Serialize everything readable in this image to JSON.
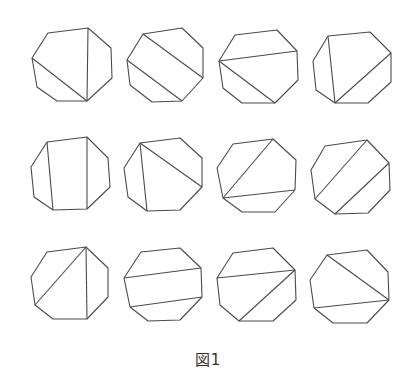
{
  "figure": {
    "caption": "図1",
    "stroke_color": "#4a4a4a",
    "octagons": [
      {
        "vertices": [
          [
            48,
            33
          ],
          [
            88,
            28
          ],
          [
            111,
            48
          ],
          [
            112,
            78
          ],
          [
            87,
            101
          ],
          [
            57,
            101
          ],
          [
            37,
            87
          ],
          [
            32,
            58
          ]
        ],
        "diagonals": [
          [
            [
              88,
              28
            ],
            [
              87,
              101
            ]
          ],
          [
            [
              32,
              58
            ],
            [
              87,
              101
            ]
          ]
        ]
      },
      {
        "vertices": [
          [
            143,
            34
          ],
          [
            182,
            28
          ],
          [
            203,
            48
          ],
          [
            203,
            78
          ],
          [
            182,
            101
          ],
          [
            152,
            102
          ],
          [
            130,
            85
          ],
          [
            127,
            60
          ]
        ],
        "diagonals": [
          [
            [
              143,
              34
            ],
            [
              203,
              78
            ]
          ],
          [
            [
              127,
              60
            ],
            [
              182,
              101
            ]
          ]
        ]
      },
      {
        "vertices": [
          [
            235,
            35
          ],
          [
            277,
            30
          ],
          [
            297,
            51
          ],
          [
            298,
            80
          ],
          [
            275,
            103
          ],
          [
            242,
            103
          ],
          [
            223,
            88
          ],
          [
            219,
            61
          ]
        ],
        "diagonals": [
          [
            [
              219,
              61
            ],
            [
              297,
              51
            ]
          ],
          [
            [
              219,
              61
            ],
            [
              275,
              103
            ]
          ]
        ]
      },
      {
        "vertices": [
          [
            328,
            36
          ],
          [
            370,
            32
          ],
          [
            391,
            53
          ],
          [
            391,
            82
          ],
          [
            368,
            103
          ],
          [
            335,
            103
          ],
          [
            316,
            90
          ],
          [
            313,
            61
          ]
        ],
        "diagonals": [
          [
            [
              328,
              36
            ],
            [
              335,
              103
            ]
          ],
          [
            [
              391,
              53
            ],
            [
              335,
              103
            ]
          ]
        ]
      },
      {
        "vertices": [
          [
            47,
            142
          ],
          [
            87,
            137
          ],
          [
            108,
            158
          ],
          [
            110,
            187
          ],
          [
            87,
            209
          ],
          [
            53,
            210
          ],
          [
            34,
            197
          ],
          [
            31,
            167
          ]
        ],
        "diagonals": [
          [
            [
              47,
              142
            ],
            [
              53,
              210
            ]
          ],
          [
            [
              87,
              137
            ],
            [
              87,
              209
            ]
          ]
        ]
      },
      {
        "vertices": [
          [
            140,
            143
          ],
          [
            180,
            138
          ],
          [
            202,
            158
          ],
          [
            202,
            187
          ],
          [
            180,
            210
          ],
          [
            147,
            211
          ],
          [
            128,
            197
          ],
          [
            124,
            168
          ]
        ],
        "diagonals": [
          [
            [
              140,
              143
            ],
            [
              147,
              211
            ]
          ],
          [
            [
              140,
              143
            ],
            [
              202,
              187
            ]
          ]
        ]
      },
      {
        "vertices": [
          [
            233,
            144
          ],
          [
            273,
            139
          ],
          [
            296,
            160
          ],
          [
            295,
            190
          ],
          [
            275,
            212
          ],
          [
            242,
            212
          ],
          [
            223,
            198
          ],
          [
            217,
            168
          ]
        ],
        "diagonals": [
          [
            [
              273,
              139
            ],
            [
              223,
              198
            ]
          ],
          [
            [
              223,
              198
            ],
            [
              295,
              190
            ]
          ]
        ]
      },
      {
        "vertices": [
          [
            325,
            146
          ],
          [
            367,
            140
          ],
          [
            389,
            163
          ],
          [
            390,
            190
          ],
          [
            368,
            213
          ],
          [
            335,
            214
          ],
          [
            315,
            199
          ],
          [
            311,
            170
          ]
        ],
        "diagonals": [
          [
            [
              367,
              140
            ],
            [
              315,
              199
            ]
          ],
          [
            [
              389,
              163
            ],
            [
              335,
              214
            ]
          ]
        ]
      },
      {
        "vertices": [
          [
            47,
            252
          ],
          [
            86,
            247
          ],
          [
            108,
            268
          ],
          [
            108,
            297
          ],
          [
            87,
            319
          ],
          [
            53,
            319
          ],
          [
            35,
            305
          ],
          [
            31,
            277
          ]
        ],
        "diagonals": [
          [
            [
              86,
              247
            ],
            [
              87,
              319
            ]
          ],
          [
            [
              86,
              247
            ],
            [
              35,
              305
            ]
          ]
        ]
      },
      {
        "vertices": [
          [
            141,
            252
          ],
          [
            180,
            248
          ],
          [
            201,
            268
          ],
          [
            202,
            297
          ],
          [
            180,
            320
          ],
          [
            148,
            321
          ],
          [
            130,
            307
          ],
          [
            124,
            278
          ]
        ],
        "diagonals": [
          [
            [
              124,
              278
            ],
            [
              201,
              268
            ]
          ],
          [
            [
              130,
              307
            ],
            [
              202,
              297
            ]
          ]
        ]
      },
      {
        "vertices": [
          [
            233,
            253
          ],
          [
            273,
            248
          ],
          [
            295,
            270
          ],
          [
            296,
            300
          ],
          [
            273,
            321
          ],
          [
            239,
            321
          ],
          [
            220,
            305
          ],
          [
            217,
            278
          ]
        ],
        "diagonals": [
          [
            [
              217,
              278
            ],
            [
              295,
              270
            ]
          ],
          [
            [
              295,
              270
            ],
            [
              239,
              321
            ]
          ]
        ]
      },
      {
        "vertices": [
          [
            327,
            255
          ],
          [
            367,
            250
          ],
          [
            388,
            272
          ],
          [
            389,
            300
          ],
          [
            367,
            323
          ],
          [
            333,
            323
          ],
          [
            314,
            308
          ],
          [
            310,
            280
          ]
        ],
        "diagonals": [
          [
            [
              327,
              255
            ],
            [
              389,
              300
            ]
          ],
          [
            [
              314,
              308
            ],
            [
              389,
              300
            ]
          ]
        ]
      }
    ]
  }
}
